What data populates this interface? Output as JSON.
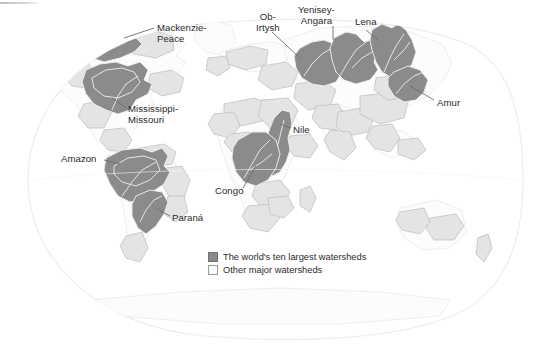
{
  "figure": {
    "title": "The world's ten largest watersheds",
    "projection": "oval world map"
  },
  "colors": {
    "largest_watershed_fill": "#8b8b8b",
    "largest_watershed_stroke": "#e8e8e8",
    "other_watershed_fill": "#e2e2e2",
    "other_watershed_stroke": "#b9b9b9",
    "land_fill": "#fbfbfb",
    "land_stroke": "#e3e3e3",
    "globe_stroke": "#ededed",
    "label_color": "#2a2a2a",
    "leader_line": "#6a6a6a",
    "background": "#ffffff"
  },
  "labels": [
    {
      "id": "mackenzie-peace",
      "text": "Mackenzie-\nPeace",
      "x": 157,
      "y": 23,
      "align": "left"
    },
    {
      "id": "ob-irtysh",
      "text": "Ob-\nIrtysh",
      "x": 256,
      "y": 12,
      "align": "left"
    },
    {
      "id": "yenisey-angara",
      "text": "Yenisey-\nAngara",
      "x": 298,
      "y": 5,
      "align": "left"
    },
    {
      "id": "lena",
      "text": "Lena",
      "x": 355,
      "y": 17,
      "align": "left"
    },
    {
      "id": "amur",
      "text": "Amur",
      "x": 437,
      "y": 98,
      "align": "left"
    },
    {
      "id": "mississippi-missouri",
      "text": "Mississippi-\nMissouri",
      "x": 128,
      "y": 104,
      "align": "left"
    },
    {
      "id": "nile",
      "text": "Nile",
      "x": 293,
      "y": 125,
      "align": "left"
    },
    {
      "id": "amazon",
      "text": "Amazon",
      "x": 61,
      "y": 154,
      "align": "left"
    },
    {
      "id": "congo",
      "text": "Congo",
      "x": 215,
      "y": 186,
      "align": "left"
    },
    {
      "id": "parana",
      "text": "Paraná",
      "x": 172,
      "y": 213,
      "align": "left"
    }
  ],
  "legend": {
    "items": [
      {
        "id": "largest",
        "swatch": "dark",
        "label": "The world's ten largest watersheds"
      },
      {
        "id": "other",
        "swatch": "light",
        "label": "Other major watersheds"
      }
    ]
  },
  "watersheds": {
    "largest": [
      "Mackenzie-Peace",
      "Mississippi-Missouri",
      "Amazon",
      "Paraná",
      "Ob-Irtysh",
      "Yenisey-Angara",
      "Lena",
      "Amur",
      "Nile",
      "Congo"
    ]
  }
}
